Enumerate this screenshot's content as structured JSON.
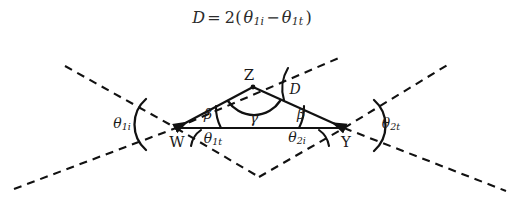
{
  "figure": {
    "title_formula": {
      "lhs": "D",
      "equals": "=",
      "rhs_prefix": "2(",
      "term1_base": "θ",
      "term1_sub": "1i",
      "minus": "−",
      "term2_base": "θ",
      "term2_sub": "1t",
      "rhs_suffix": ")",
      "plain": "D = 2(θ1i − θ1t)"
    },
    "stroke_color": "#111111",
    "background_color": "#ffffff",
    "vertices": [
      {
        "name": "W",
        "label": "W",
        "x": 176,
        "y": 128,
        "label_x": 177,
        "label_y": 142
      },
      {
        "name": "Z",
        "label": "Z",
        "x": 253,
        "y": 87,
        "label_x": 249,
        "label_y": 75
      },
      {
        "name": "Y",
        "label": "Y",
        "x": 344,
        "y": 128,
        "label_x": 346,
        "label_y": 142
      }
    ],
    "angles": [
      {
        "name": "theta-1i",
        "base": "θ",
        "sub": "1i",
        "label_x": 122,
        "label_y": 124
      },
      {
        "name": "theta-1t",
        "base": "θ",
        "sub": "1t",
        "label_x": 213,
        "label_y": 139
      },
      {
        "name": "beta-left",
        "base": "β",
        "sub": "",
        "label_x": 208,
        "label_y": 114
      },
      {
        "name": "gamma",
        "base": "γ",
        "sub": "",
        "label_x": 254,
        "label_y": 118
      },
      {
        "name": "beta-right",
        "base": "β",
        "sub": "",
        "label_x": 301,
        "label_y": 114
      },
      {
        "name": "theta-2i",
        "base": "θ",
        "sub": "2i",
        "label_x": 297,
        "label_y": 138
      },
      {
        "name": "D",
        "base": "D",
        "sub": "",
        "label_x": 295,
        "label_y": 89
      },
      {
        "name": "theta-2t",
        "base": "θ",
        "sub": "2t",
        "label_x": 391,
        "label_y": 124
      }
    ]
  }
}
